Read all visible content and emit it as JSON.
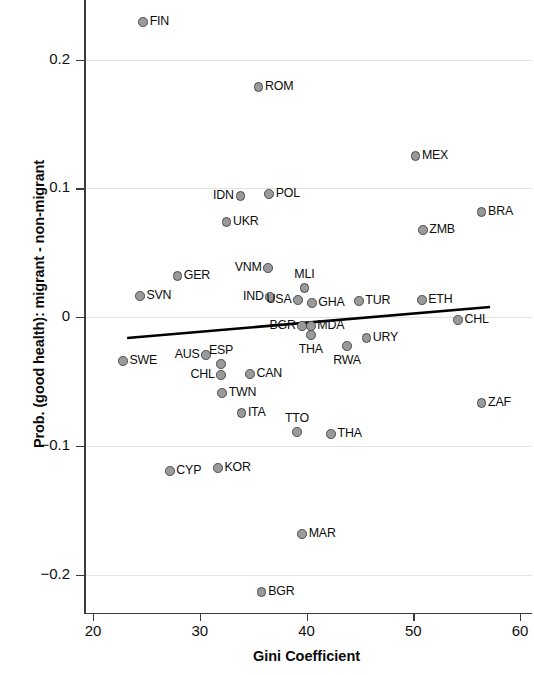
{
  "chart_data": {
    "type": "scatter",
    "title": "",
    "xlabel": "Gini Coefficient",
    "ylabel": "Prob. (good health): migrant - non-migrant",
    "xlim": [
      18.5,
      61.5
    ],
    "ylim": [
      -0.246,
      0.246
    ],
    "xticks": [
      "20",
      "30",
      "40",
      "50",
      "60"
    ],
    "xtick_values": [
      20,
      30,
      40,
      50,
      60
    ],
    "yticks": [
      "0.2",
      "0.1",
      "0",
      "−0.1",
      "−0.2"
    ],
    "ytick_values": [
      0.2,
      0.1,
      0,
      -0.1,
      -0.2
    ],
    "grid": "horizontal",
    "legend": "none",
    "point_labels": true,
    "marker_fill": "#9a9a9a",
    "marker_edge": "#4a4a4a",
    "fit_line": {
      "name": "linear fit",
      "color": "#000000",
      "x_start": 23.2,
      "y_start": -0.0163,
      "x_end": 57.2,
      "y_end": 0.0078
    },
    "points": [
      {
        "label": "FIN",
        "x": 24.7,
        "y": 0.2291,
        "pos": "right"
      },
      {
        "label": "ROM",
        "x": 35.5,
        "y": 0.1786,
        "pos": "right"
      },
      {
        "label": "MEX",
        "x": 50.2,
        "y": 0.125,
        "pos": "right"
      },
      {
        "label": "IDN",
        "x": 33.8,
        "y": 0.094,
        "pos": "left"
      },
      {
        "label": "POL",
        "x": 36.5,
        "y": 0.0956,
        "pos": "right"
      },
      {
        "label": "BRA",
        "x": 56.4,
        "y": 0.0816,
        "pos": "right"
      },
      {
        "label": "UKR",
        "x": 32.5,
        "y": 0.0738,
        "pos": "right"
      },
      {
        "label": "ZMB",
        "x": 50.9,
        "y": 0.0676,
        "pos": "right"
      },
      {
        "label": "GER",
        "x": 27.9,
        "y": 0.0319,
        "pos": "right"
      },
      {
        "label": "VNM",
        "x": 36.4,
        "y": 0.0381,
        "pos": "left"
      },
      {
        "label": "MLI",
        "x": 39.8,
        "y": 0.0225,
        "pos": "above"
      },
      {
        "label": "SVN",
        "x": 24.4,
        "y": 0.0163,
        "pos": "right"
      },
      {
        "label": "IND",
        "x": 36.6,
        "y": 0.0155,
        "pos": "left"
      },
      {
        "label": "USA",
        "x": 39.2,
        "y": 0.0132,
        "pos": "left"
      },
      {
        "label": "GHA",
        "x": 40.5,
        "y": 0.0109,
        "pos": "right"
      },
      {
        "label": "TUR",
        "x": 44.9,
        "y": 0.0124,
        "pos": "right"
      },
      {
        "label": "ETH",
        "x": 50.8,
        "y": 0.0132,
        "pos": "right"
      },
      {
        "label": "CHL",
        "x": 54.2,
        "y": -0.0023,
        "pos": "right"
      },
      {
        "label": "BGR",
        "x": 39.6,
        "y": -0.007,
        "pos": "left"
      },
      {
        "label": "MDA",
        "x": 40.4,
        "y": -0.007,
        "pos": "right"
      },
      {
        "label": "URY",
        "x": 45.6,
        "y": -0.0163,
        "pos": "right"
      },
      {
        "label": "THA",
        "x": 40.4,
        "y": -0.014,
        "pos": "below"
      },
      {
        "label": "RWA",
        "x": 43.8,
        "y": -0.0225,
        "pos": "below"
      },
      {
        "label": "SWE",
        "x": 22.8,
        "y": -0.0342,
        "pos": "right"
      },
      {
        "label": "AUS",
        "x": 30.6,
        "y": -0.0295,
        "pos": "left"
      },
      {
        "label": "ESP",
        "x": 32.0,
        "y": -0.0365,
        "pos": "above"
      },
      {
        "label": "CHL",
        "x": 32.0,
        "y": -0.045,
        "pos": "left"
      },
      {
        "label": "CAN",
        "x": 34.7,
        "y": -0.0443,
        "pos": "right"
      },
      {
        "label": "TWN",
        "x": 32.1,
        "y": -0.059,
        "pos": "right"
      },
      {
        "label": "ITA",
        "x": 33.9,
        "y": -0.0745,
        "pos": "right"
      },
      {
        "label": "TTO",
        "x": 39.1,
        "y": -0.0893,
        "pos": "above"
      },
      {
        "label": "THA",
        "x": 42.3,
        "y": -0.0909,
        "pos": "right"
      },
      {
        "label": "ZAF",
        "x": 56.4,
        "y": -0.0668,
        "pos": "right"
      },
      {
        "label": "CYP",
        "x": 27.2,
        "y": -0.1196,
        "pos": "right"
      },
      {
        "label": "KOR",
        "x": 31.7,
        "y": -0.1173,
        "pos": "right"
      },
      {
        "label": "MAR",
        "x": 39.6,
        "y": -0.1685,
        "pos": "right"
      },
      {
        "label": "BGR",
        "x": 35.8,
        "y": -0.2136,
        "pos": "right"
      }
    ]
  }
}
